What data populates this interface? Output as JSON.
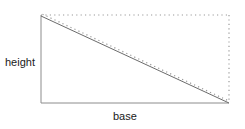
{
  "figure": {
    "title": "",
    "labels": {
      "height": "height",
      "base": "base"
    },
    "colors": {
      "stroke_solid": "#8c8c8c",
      "stroke_dotted": "#9a9a9a",
      "diagonal": "#6b6b6b",
      "text": "#1a1a1a",
      "background": "#ffffff"
    },
    "geometry": {
      "left_x": 41,
      "right_x": 229,
      "top_y": 15,
      "bottom_y": 103,
      "width": 188,
      "height": 88
    },
    "elements": [
      {
        "name": "left-edge",
        "style": "solid",
        "role": "height-side"
      },
      {
        "name": "bottom-edge",
        "style": "solid",
        "role": "base-side"
      },
      {
        "name": "top-edge",
        "style": "dotted",
        "role": "construction"
      },
      {
        "name": "right-edge",
        "style": "dotted",
        "role": "construction"
      },
      {
        "name": "diagonal",
        "style": "solid",
        "role": "hypotenuse"
      },
      {
        "name": "diagonal-offset",
        "style": "dotted",
        "role": "parallel-construction"
      }
    ]
  }
}
